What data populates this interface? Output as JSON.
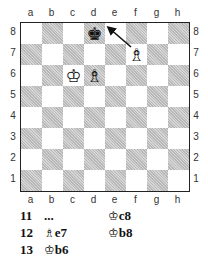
{
  "board": {
    "files": [
      "a",
      "b",
      "c",
      "d",
      "e",
      "f",
      "g",
      "h"
    ],
    "ranks": [
      "8",
      "7",
      "6",
      "5",
      "4",
      "3",
      "2",
      "1"
    ],
    "pieces": [
      {
        "square": "d8",
        "piece": "black-king",
        "glyph": "♚"
      },
      {
        "square": "f7",
        "piece": "white-bishop",
        "glyph": "♗"
      },
      {
        "square": "c6",
        "piece": "white-king",
        "glyph": "♔"
      },
      {
        "square": "d6",
        "piece": "white-bishop",
        "glyph": "♗"
      }
    ],
    "arrow": {
      "from": "f7",
      "to": "e8"
    }
  },
  "moves": [
    {
      "number": "11",
      "white": "...",
      "black_fig": "♔",
      "black": "c8"
    },
    {
      "number": "12",
      "white_fig": "♗",
      "white": "e7",
      "black_fig": "♔",
      "black": "b8"
    },
    {
      "number": "13",
      "white_fig": "♔",
      "white": "b6"
    }
  ]
}
